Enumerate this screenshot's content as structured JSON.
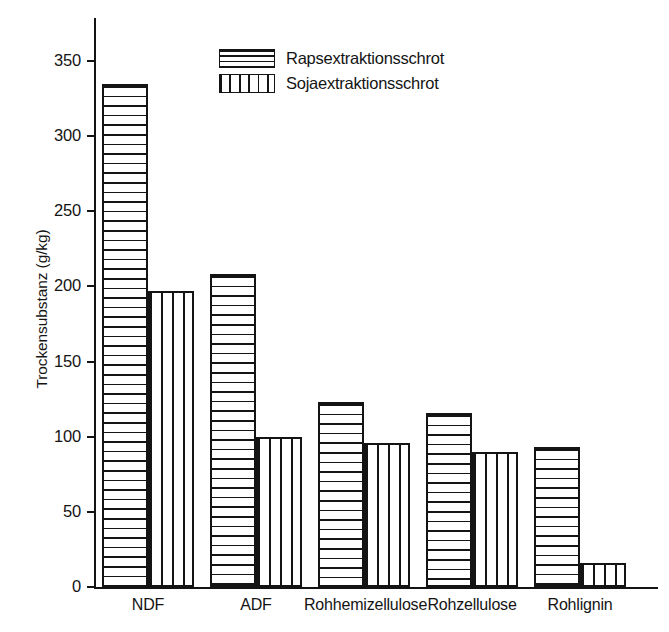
{
  "chart_data": {
    "type": "bar",
    "title": "",
    "xlabel": "",
    "ylabel": "Trockensubstanz (g/kg)",
    "ylim": [
      0,
      350
    ],
    "yticks": [
      0,
      50,
      100,
      150,
      200,
      250,
      300,
      350
    ],
    "ytick_labels": [
      "0",
      "50",
      "100",
      "150",
      "200",
      "250",
      "300",
      "350"
    ],
    "grid": false,
    "legend_position": "upper-center",
    "categories": [
      "NDF",
      "ADF",
      "Rohhemizellulose",
      "Rohzellulose",
      "Rohlignin"
    ],
    "series": [
      {
        "name": "Rapsextraktionsschrot",
        "pattern": "horizontal-lines",
        "values": [
          335,
          208,
          123,
          116,
          93
        ]
      },
      {
        "name": "Sojaextraktionsschrot",
        "pattern": "vertical-lines",
        "values": [
          197,
          100,
          96,
          90,
          16
        ]
      }
    ]
  },
  "axis": {
    "y_title": "Trockensubstanz (g/kg)"
  },
  "legend": {
    "entries": [
      {
        "label": "Rapsextraktionsschrot",
        "pattern": "horizontal-lines"
      },
      {
        "label": "Sojaextraktionsschrot",
        "pattern": "vertical-lines"
      }
    ]
  },
  "colors": {
    "ink": "#141414",
    "background": "#ffffff"
  }
}
